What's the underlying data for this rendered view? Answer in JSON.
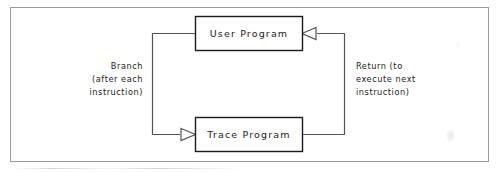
{
  "figure": {
    "kind": "flow-diagram",
    "frame": {
      "border_color": "#9a9a9a",
      "background": "#ffffff"
    },
    "ink_color": "#1a1a1a"
  },
  "nodes": [
    {
      "id": "user-program",
      "label": "User Program"
    },
    {
      "id": "trace-program",
      "label": "Trace Program"
    }
  ],
  "edges": [
    {
      "id": "branch",
      "from": "user-program",
      "to": "trace-program",
      "arrowhead": "hollow-triangle",
      "label_lines": [
        "Branch",
        "(after each",
        "instruction)"
      ],
      "label_align": "right"
    },
    {
      "id": "return",
      "from": "trace-program",
      "to": "user-program",
      "arrowhead": "hollow-triangle",
      "label_lines": [
        "Return (to",
        "execute next",
        "instruction)"
      ],
      "label_align": "left"
    }
  ],
  "labels": {
    "branch_line1": "Branch",
    "branch_line2": "(after each",
    "branch_line3": "instruction)",
    "return_line1": "Return (to",
    "return_line2": "execute next",
    "return_line3": "instruction)"
  }
}
